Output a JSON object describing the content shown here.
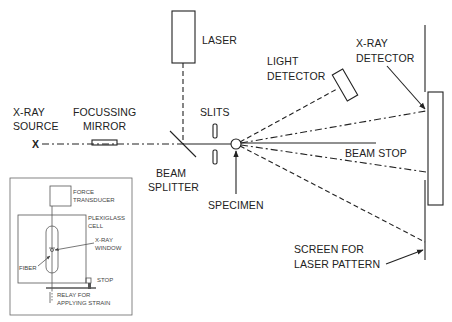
{
  "labels": {
    "laser": "LASER",
    "light_detector_1": "LIGHT",
    "light_detector_2": "DETECTOR",
    "xray_detector_1": "X-RAY",
    "xray_detector_2": "DETECTOR",
    "xray_source_1": "X-RAY",
    "xray_source_2": "SOURCE",
    "source_mark": "X",
    "focussing_mirror_1": "FOCUSSING",
    "focussing_mirror_2": "MIRROR",
    "slits": "SLITS",
    "beam_stop": "BEAM STOP",
    "beam_splitter_1": "BEAM",
    "beam_splitter_2": "SPLITTER",
    "specimen": "SPECIMEN",
    "screen_1": "SCREEN FOR",
    "screen_2": "LASER PATTERN"
  },
  "inset": {
    "force_transducer_1": "FORCE",
    "force_transducer_2": "TRANSDUCER",
    "plexiglass_cell_1": "PLEXIGLASS",
    "plexiglass_cell_2": "CELL",
    "xray_window_1": "X-RAY",
    "xray_window_2": "WINDOW",
    "fiber": "FIBER",
    "stop": "STOP",
    "relay_1": "RELAY FOR",
    "relay_2": "APPLYING STRAIN"
  },
  "colors": {
    "line": "#222222",
    "background": "#ffffff"
  }
}
